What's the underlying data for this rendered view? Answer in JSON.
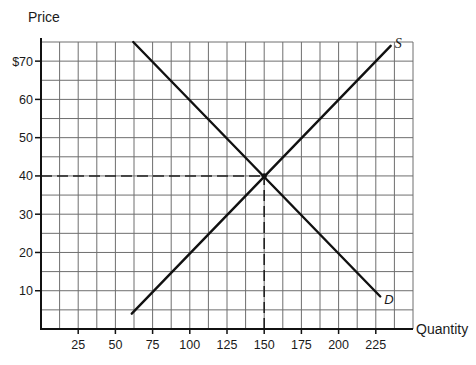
{
  "chart_data": {
    "type": "line",
    "title": "",
    "xlabel": "Quantity",
    "ylabel": "Price",
    "xlim": [
      0,
      250
    ],
    "ylim": [
      0,
      75
    ],
    "grid": true,
    "grid_step_x": 12.5,
    "grid_step_y": 5,
    "x_ticks": [
      25,
      50,
      75,
      100,
      125,
      150,
      175,
      200,
      225
    ],
    "x_tick_labels": [
      "25",
      "50",
      "75",
      "100",
      "125",
      "150",
      "175",
      "200",
      "225"
    ],
    "y_ticks": [
      10,
      20,
      30,
      40,
      50,
      60,
      70
    ],
    "y_tick_labels": [
      "10",
      "20",
      "30",
      "40",
      "50",
      "60",
      "$70"
    ],
    "series": [
      {
        "name": "S",
        "label": "S",
        "role": "supply",
        "x": [
          61,
          235
        ],
        "y": [
          4,
          74
        ]
      },
      {
        "name": "D",
        "label": "D",
        "role": "demand",
        "x": [
          62,
          228
        ],
        "y": [
          75,
          8.5
        ]
      }
    ],
    "annotations": [
      {
        "type": "equilibrium",
        "x": 150,
        "y": 40
      },
      {
        "type": "dashed-hline",
        "y": 40,
        "from_x": 0,
        "to_x": 150
      },
      {
        "type": "dashed-vline",
        "x": 150,
        "from_y": 0,
        "to_y": 40
      }
    ],
    "legend": "none (curve labels S and D at line ends)"
  },
  "colors": {
    "line": "#111111",
    "grid": "#6e6e6e",
    "background": "#ffffff"
  }
}
